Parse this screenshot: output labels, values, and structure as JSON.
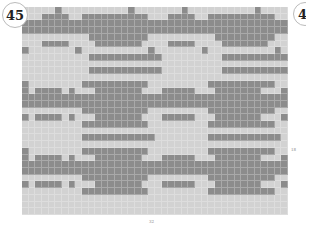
{
  "badge": {
    "number": "45",
    "next_number": "4"
  },
  "grid": {
    "columns": 40,
    "rows": 31,
    "colors": {
      "dark": "#8c8c8c",
      "light": "#d2d2d2"
    },
    "pattern": [
      "LLLLLDLLLLLLLLLLDLLLLLLLDLLLLLLLLLLDLLLL",
      "LLLDDDDLLDDDDDDDDDDLLLDDDDLLDDDDDDDDDDLL",
      "DDDDDDDDDDDDDDDDDDDDDDDDDDDDDDDDDDDDDDDD",
      "DDDDDDDDDDDDDDDDDDDDDDDDDDDDDDDDDDDDDDDD",
      "LLLLLLLLLLDDDDDDDDDLLLLLLLLLLDDDDDDDDDLLL",
      "LLLDDDDLLLLDDDDDDDLLLLDDDDLLLLDDDDDDDLLLL",
      "DLLLLLLLDLLLLLLLLLLDLLLLLLLDLLLLLLLLLLDLL",
      "LLLLLLLLLLDDDDDDDDDDDLLLLLLLLLDDDDDDDDDDD",
      "LLLLLLLLLLLLLLLLLLLLLLLLLLLLLLLLLLLLLLLLL",
      "LLLLLLLLLLDDDDDDDDDDDLLLLLLLLLDDDDDDDDDDD",
      "LLLLLLLLLLLLLLLLLLLLLLLLLLLLLLLLLLLLLLLLL",
      "DLLLLLLLLDDDDDDDDDDLLLLLLLLLDDDDDDDDDDLLL",
      "DLDDDDLDLLLDDDDDDDLLLDDDDDLLLDDDDDDDLLLDD",
      "DDDDDDDDDDDDDDDDDDDDDDDDDDDDDDDDDDDDDDDDD",
      "DDDDDDDDDDDDDDDDDDDDDDDDDDDDDDDDDDDDDDDDD",
      "LLLLLLLLLDDDDDDDDDDLLLLLLLLLDDDDDDDDDDLLL",
      "DLDDDDLDLLLDDDDDDDLLLDDDDDLLLDDDDDDDLLLDD",
      "LLLLLLLLLDDDDDDDDDDLLLLLLLLLDDDDDDDDDDLLL",
      "LLLLLLLLLLLLLLLLLLLLLLLLLLLLLLLLLLLLLLLLL",
      "LLLLLLLLLDDDDDDDDDDDLLLLLLLLDDDDDDDDDDDLL",
      "LLLLLLLLLLLLLLLLLLLLLLLLLLLLLLLLLLLLLLLLL",
      "DLLLLLLLLDDDDDDDDDDLLLLLLLLLDDDDDDDDDDLLL",
      "DLDDDDLDLLLDDDDDDDLLLDDDDDLLLDDDDDDDLLLDD",
      "DDDDDDDDDDDDDDDDDDDDDDDDDDDDDDDDDDDDDDDDD",
      "DDDDDDDDDDDDDDDDDDDDDDDDDDDDDDDDDDDDDDDDD",
      "LLLLLLLLLDDDDDDDDDDLLLLLLLLLDDDDDDDDDDLLL",
      "DLDDDDLDLLLDDDDDDDLLLDDDDDLLLDDDDDDDLLLDD",
      "LLLLLLLLLDDDDDDDDDDLLLLLLLLLDDDDDDDDDDLLL",
      "LLLLLLLLLLLLLLLLLLLLLLLLLLLLLLLLLLLLLLLLL",
      "LLLLLLLLLLLLLLLLLLLLLLLLLLLLLLLLLLLLLLLLL",
      "LLLLLLLLLLLLLLLLLLLLLLLLLLLLLLLLLLLLLLLLL"
    ]
  },
  "labels": {
    "right": "18",
    "bottom": "32"
  }
}
